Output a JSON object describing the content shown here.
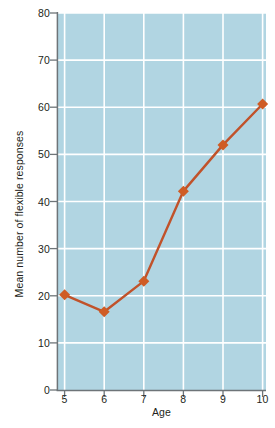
{
  "chart_data": {
    "type": "line",
    "title": "",
    "subtitle": "",
    "xlabel": "Age",
    "ylabel": "Mean number of flexible responses",
    "x": [
      5,
      6,
      7,
      8,
      9,
      10
    ],
    "values": [
      20.2,
      16.6,
      23.1,
      42.2,
      52.0,
      60.7
    ],
    "series": [
      {
        "name": "Mean number of flexible responses",
        "values": [
          20.2,
          16.6,
          23.1,
          42.2,
          52.0,
          60.7
        ]
      }
    ],
    "xlim": [
      5,
      10
    ],
    "ylim": [
      0,
      80
    ],
    "x_ticks": [
      5,
      6,
      7,
      8,
      9,
      10
    ],
    "y_ticks": [
      0,
      10,
      20,
      30,
      40,
      50,
      60,
      70,
      80
    ],
    "x_tick_labels": [
      "5",
      "6",
      "7",
      "8",
      "9",
      "10"
    ],
    "y_tick_labels": [
      "0",
      "10",
      "20",
      "30",
      "40",
      "50",
      "60",
      "70",
      "80"
    ],
    "grid": true,
    "grid_axes": "both",
    "legend": false,
    "legend_position": "none",
    "marker": "diamond",
    "annotations": []
  },
  "colors": {
    "plot_background": "#b1d5e2",
    "grid_line": "#ffffff",
    "axis_line": "#6e7478",
    "tick_mark": "#6e7478",
    "series_line": "#c1522a",
    "marker_fill": "#cf5c25",
    "text": "#231f20",
    "page_background": "#ffffff"
  },
  "axes": {
    "y_title": "Mean number of flexible responses",
    "x_title": "Age"
  }
}
